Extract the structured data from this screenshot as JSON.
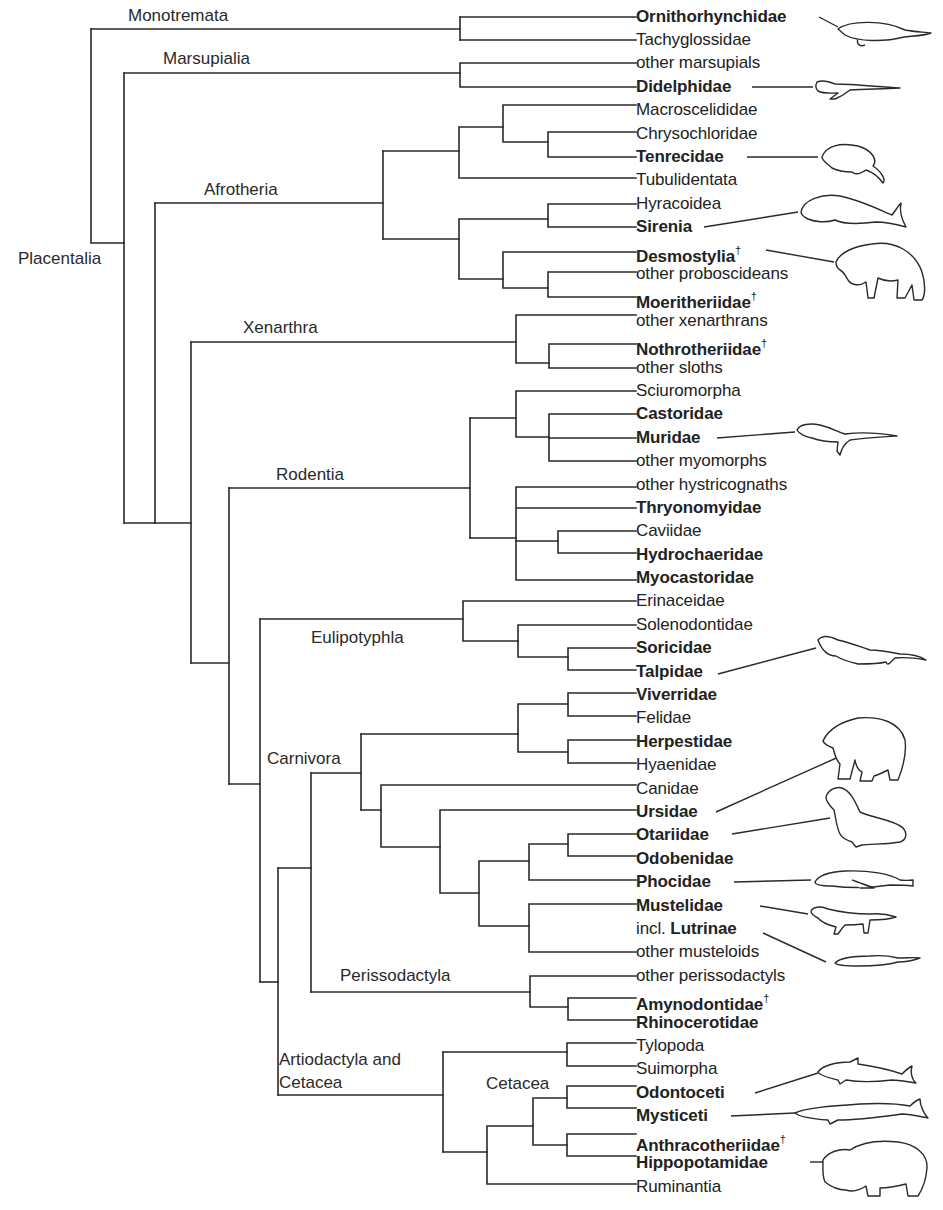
{
  "figure": {
    "type": "phylogenetic-tree",
    "root_label": "Placentalia",
    "dagger_symbol": "†",
    "line_color": "#2a2a2a",
    "background": "#ffffff"
  },
  "clades": {
    "monotremata": "Monotremata",
    "marsupialia": "Marsupialia",
    "placentalia": "Placentalia",
    "afrotheria": "Afrotheria",
    "xenarthra": "Xenarthra",
    "rodentia": "Rodentia",
    "eulipotyphla": "Eulipotyphla",
    "carnivora": "Carnivora",
    "perissodactyla": "Perissodactyla",
    "artiodactyla_line1": "Artiodactyla and",
    "artiodactyla_line2": "Cetacea",
    "cetacea": "Cetacea"
  },
  "taxa": [
    {
      "name": "Ornithorhynchidae",
      "bold": true,
      "extinct": false,
      "illustrated": "platypus"
    },
    {
      "name": "Tachyglossidae",
      "bold": false,
      "extinct": false
    },
    {
      "name": "other marsupials",
      "bold": false,
      "extinct": false
    },
    {
      "name": "Didelphidae",
      "bold": true,
      "extinct": false,
      "illustrated": "opossum"
    },
    {
      "name": "Macroscelididae",
      "bold": false,
      "extinct": false
    },
    {
      "name": "Chrysochloridae",
      "bold": false,
      "extinct": false
    },
    {
      "name": "Tenrecidae",
      "bold": true,
      "extinct": false,
      "illustrated": "tenrec"
    },
    {
      "name": "Tubulidentata",
      "bold": false,
      "extinct": false
    },
    {
      "name": "Hyracoidea",
      "bold": false,
      "extinct": false
    },
    {
      "name": "Sirenia",
      "bold": true,
      "extinct": false,
      "illustrated": "dugong"
    },
    {
      "name": "Desmostylia",
      "bold": true,
      "extinct": true,
      "illustrated": "desmostylian"
    },
    {
      "name": "other proboscideans",
      "bold": false,
      "extinct": false
    },
    {
      "name": "Moeritheriidae",
      "bold": true,
      "extinct": true
    },
    {
      "name": "other xenarthrans",
      "bold": false,
      "extinct": false
    },
    {
      "name": "Nothrotheriidae",
      "bold": true,
      "extinct": true
    },
    {
      "name": "other sloths",
      "bold": false,
      "extinct": false
    },
    {
      "name": "Sciuromorpha",
      "bold": false,
      "extinct": false
    },
    {
      "name": "Castoridae",
      "bold": true,
      "extinct": false
    },
    {
      "name": "Muridae",
      "bold": true,
      "extinct": false,
      "illustrated": "water-rat"
    },
    {
      "name": "other myomorphs",
      "bold": false,
      "extinct": false
    },
    {
      "name": "other hystricognaths",
      "bold": false,
      "extinct": false
    },
    {
      "name": "Thryonomyidae",
      "bold": true,
      "extinct": false
    },
    {
      "name": "Caviidae",
      "bold": false,
      "extinct": false
    },
    {
      "name": "Hydrochaeridae",
      "bold": true,
      "extinct": false
    },
    {
      "name": "Myocastoridae",
      "bold": true,
      "extinct": false
    },
    {
      "name": "Erinaceidae",
      "bold": false,
      "extinct": false
    },
    {
      "name": "Solenodontidae",
      "bold": false,
      "extinct": false
    },
    {
      "name": "Soricidae",
      "bold": true,
      "extinct": false
    },
    {
      "name": "Talpidae",
      "bold": true,
      "extinct": false,
      "illustrated": "desman"
    },
    {
      "name": "Viverridae",
      "bold": true,
      "extinct": false
    },
    {
      "name": "Felidae",
      "bold": false,
      "extinct": false
    },
    {
      "name": "Herpestidae",
      "bold": true,
      "extinct": false
    },
    {
      "name": "Hyaenidae",
      "bold": false,
      "extinct": false
    },
    {
      "name": "Canidae",
      "bold": false,
      "extinct": false
    },
    {
      "name": "Ursidae",
      "bold": true,
      "extinct": false,
      "illustrated": "polar-bear"
    },
    {
      "name": "Otariidae",
      "bold": true,
      "extinct": false,
      "illustrated": "sea-lion"
    },
    {
      "name": "Odobenidae",
      "bold": true,
      "extinct": false
    },
    {
      "name": "Phocidae",
      "bold": true,
      "extinct": false,
      "illustrated": "seal"
    },
    {
      "name": "Mustelidae",
      "bold": true,
      "extinct": false,
      "illustrated": "mink"
    },
    {
      "name": "Lutrinae",
      "prefix": "incl. ",
      "bold": true,
      "extinct": false,
      "illustrated": "otter"
    },
    {
      "name": "other musteloids",
      "bold": false,
      "extinct": false
    },
    {
      "name": "other perissodactyls",
      "bold": false,
      "extinct": false
    },
    {
      "name": "Amynodontidae",
      "bold": true,
      "extinct": true
    },
    {
      "name": "Rhinocerotidae",
      "bold": true,
      "extinct": false
    },
    {
      "name": "Tylopoda",
      "bold": false,
      "extinct": false
    },
    {
      "name": "Suimorpha",
      "bold": false,
      "extinct": false
    },
    {
      "name": "Odontoceti",
      "bold": true,
      "extinct": false,
      "illustrated": "dolphin"
    },
    {
      "name": "Mysticeti",
      "bold": true,
      "extinct": false,
      "illustrated": "baleen-whale"
    },
    {
      "name": "Anthracotheriidae",
      "bold": true,
      "extinct": true
    },
    {
      "name": "Hippopotamidae",
      "bold": true,
      "extinct": false,
      "illustrated": "hippopotamus"
    },
    {
      "name": "Ruminantia",
      "bold": false,
      "extinct": false
    }
  ]
}
